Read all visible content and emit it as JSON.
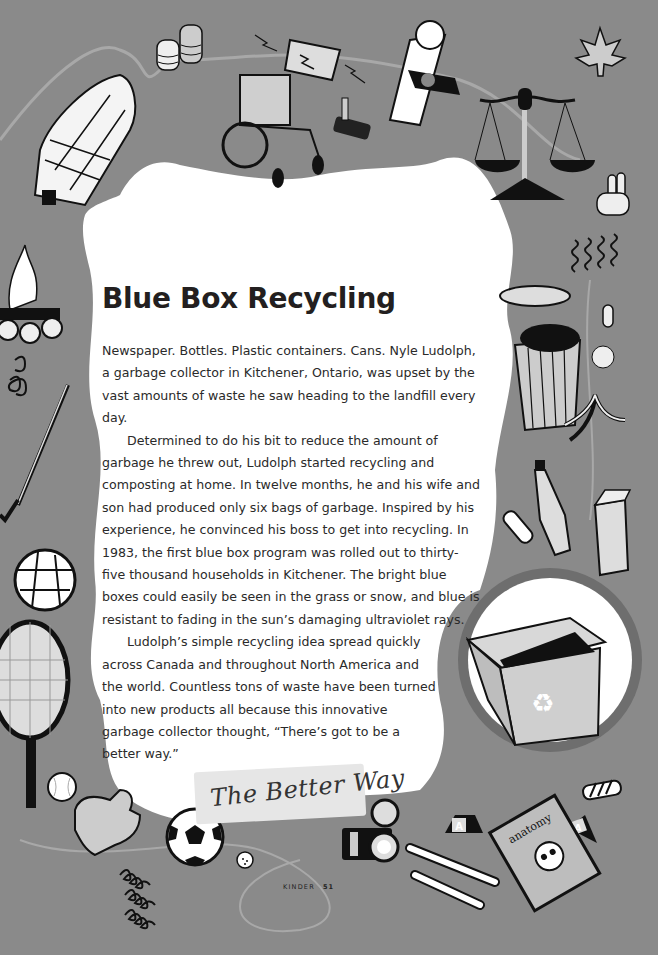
{
  "article": {
    "title": "Blue Box Recycling",
    "paragraphs": [
      "Newspaper. Bottles. Plastic containers. Cans. Nyle Ludolph, a garbage collector in Kitchener, Ontario, was upset by the vast amounts of waste he saw heading to the landfill every day.",
      "Determined to do his bit to reduce the amount of garbage he threw out, Ludolph started recycling and composting at home. In twelve months, he and his wife and son had produced only six bags of garbage. Inspired by his experience, he convinced his boss to get into recycling. In 1983, the first blue box program was rolled out to thirty-five thousand households in Kitchener. The bright blue boxes could easily be seen in the grass or snow, and blue is resistant to fading in the sun’s damaging ultraviolet rays.",
      "Ludolph’s simple recycling idea spread quickly across Canada and throughout North America and the world. Countless tons of waste have been turned into new products all because this innovative garbage collector thought, “There’s got to be a better way.”"
    ],
    "banner_label": "The Better Way"
  },
  "footer": {
    "book_title": "KINDER",
    "page_number": "51"
  },
  "illustrations": [
    "longhouse-icon",
    "pottery-vases-icon",
    "battery-icon",
    "wheelchair-icon",
    "joystick-icon",
    "scroll-diploma-icon",
    "balance-scale-icon",
    "maple-leaf-icon",
    "peace-hand-icon",
    "squiggles-icon",
    "campfire-icon",
    "spring-coil-icon",
    "golf-club-icon",
    "volleyball-icon",
    "tennis-racket-icon",
    "baseball-icon",
    "baseball-glove-icon",
    "soccer-ball-icon",
    "golf-ball-icon",
    "springs-icon",
    "camera-icon",
    "bones-icon",
    "anatomy-book-icon",
    "letter-block-icon",
    "garbage-can-icon",
    "apple-core-icon",
    "crumpled-paper-icon",
    "banana-peel-icon",
    "bottle-icon",
    "can-icon",
    "milk-carton-icon",
    "recycling-box-icon"
  ],
  "anatomy_book_label": "anatomy",
  "colors": {
    "background_gray": "#8a8a8a",
    "page_white": "#ffffff",
    "ink": "#231f20"
  }
}
